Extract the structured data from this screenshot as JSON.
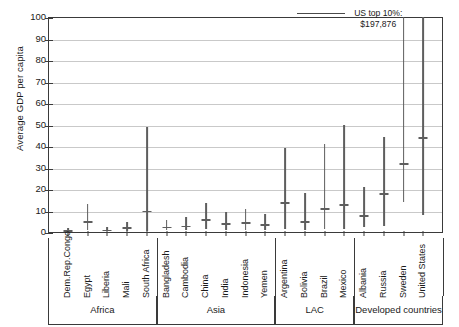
{
  "chart_data": {
    "type": "bar",
    "title": "",
    "subtitle": "",
    "xlabel": "",
    "ylabel": "Average GDP per capita",
    "ylim": [
      0,
      100
    ],
    "ytick_labels": [
      "0",
      "10",
      "20",
      "30",
      "40",
      "50",
      "60",
      "70",
      "80",
      "90",
      "100"
    ],
    "ytick_values": [
      0,
      10,
      20,
      30,
      40,
      50,
      60,
      70,
      80,
      90,
      100
    ],
    "grid": true,
    "legend": "none",
    "series_description": "Vertical range bars showing min-to-max average GDP per capita by country, with a horizontal tick marking the mean",
    "categories": [
      "Dem.Rep.Congo",
      "Egypt",
      "Liberia",
      "Mali",
      "South Africa",
      "Bangladesh",
      "Cambodia",
      "China",
      "India",
      "Indonesia",
      "Yemen",
      "Argentina",
      "Bolivia",
      "Brazil",
      "Mexico",
      "Albania",
      "Russia",
      "Sweden",
      "United States"
    ],
    "points": [
      {
        "country": "Dem.Rep.Congo",
        "group": "Africa",
        "low": 0.3,
        "high": 1.8,
        "mean": 0.9
      },
      {
        "country": "Egypt",
        "group": "Africa",
        "low": 1.0,
        "high": 13.0,
        "mean": 5.0
      },
      {
        "country": "Liberia",
        "group": "Africa",
        "low": 0.3,
        "high": 2.5,
        "mean": 1.1
      },
      {
        "country": "Mali",
        "group": "Africa",
        "low": 0.5,
        "high": 4.5,
        "mean": 2.2
      },
      {
        "country": "South Africa",
        "group": "Africa",
        "low": 0.5,
        "high": 49.0,
        "mean": 10.0
      },
      {
        "country": "Bangladesh",
        "group": "Asia",
        "low": 0.8,
        "high": 5.5,
        "mean": 2.5
      },
      {
        "country": "Cambodia",
        "group": "Asia",
        "low": 0.8,
        "high": 7.0,
        "mean": 3.0
      },
      {
        "country": "China",
        "group": "Asia",
        "low": 1.5,
        "high": 13.5,
        "mean": 6.0
      },
      {
        "country": "India",
        "group": "Asia",
        "low": 1.0,
        "high": 9.5,
        "mean": 4.0
      },
      {
        "country": "Indonesia",
        "group": "Asia",
        "low": 1.0,
        "high": 10.5,
        "mean": 4.5
      },
      {
        "country": "Yemen",
        "group": "Asia",
        "low": 0.8,
        "high": 8.5,
        "mean": 3.5
      },
      {
        "country": "Argentina",
        "group": "LAC",
        "low": 1.5,
        "high": 39.0,
        "mean": 14.0
      },
      {
        "country": "Bolivia",
        "group": "LAC",
        "low": 1.0,
        "high": 18.0,
        "mean": 5.0
      },
      {
        "country": "Brazil",
        "group": "LAC",
        "low": 1.5,
        "high": 41.0,
        "mean": 11.0
      },
      {
        "country": "Mexico",
        "group": "LAC",
        "low": 1.5,
        "high": 50.0,
        "mean": 13.0
      },
      {
        "country": "Albania",
        "group": "Developed countries",
        "low": 2.5,
        "high": 21.0,
        "mean": 8.0
      },
      {
        "country": "Russia",
        "group": "Developed countries",
        "low": 3.0,
        "high": 44.0,
        "mean": 18.0
      },
      {
        "country": "Sweden",
        "group": "Developed countries",
        "low": 14.0,
        "high": 100.0,
        "mean": 32.0
      },
      {
        "country": "United States",
        "group": "Developed countries",
        "low": 8.0,
        "high": 100.0,
        "mean": 44.0
      }
    ],
    "groups": [
      {
        "label": "Africa",
        "start": "Dem.Rep.Congo",
        "end": "South Africa",
        "count": 5
      },
      {
        "label": "Asia",
        "start": "Bangladesh",
        "end": "Yemen",
        "count": 6
      },
      {
        "label": "LAC",
        "start": "Argentina",
        "end": "Mexico",
        "count": 4
      },
      {
        "label": "Developed countries",
        "start": "Albania",
        "end": "United States",
        "count": 4
      }
    ],
    "annotations": [
      {
        "name": "us-top-decile",
        "line1": "US top 10%:",
        "line2": "$197,876",
        "target": "United States"
      }
    ],
    "colors": {
      "bar": "#5e5e5e",
      "axis": "#3a3a3a",
      "grid": "#c9c9c9",
      "text": "#1a1a1a",
      "background": "#ffffff"
    }
  }
}
